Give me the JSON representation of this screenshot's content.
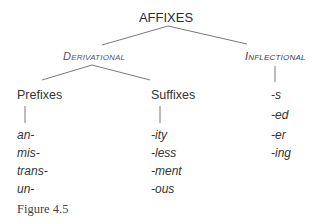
{
  "diagram": {
    "root": "AFFIXES",
    "branches": [
      {
        "label": "Derivational",
        "children": [
          {
            "label": "Prefixes",
            "items": [
              "an-",
              "mis-",
              "trans-",
              "un-"
            ]
          },
          {
            "label": "Suffixes",
            "items": [
              "-ity",
              "-less",
              "-ment",
              "-ous"
            ]
          }
        ]
      },
      {
        "label": "Inflectional",
        "items": [
          "-s",
          "-ed",
          "-er",
          "-ing"
        ]
      }
    ]
  },
  "caption": "Figure 4.5",
  "colors": {
    "line": "#555555",
    "text": "#333333"
  }
}
